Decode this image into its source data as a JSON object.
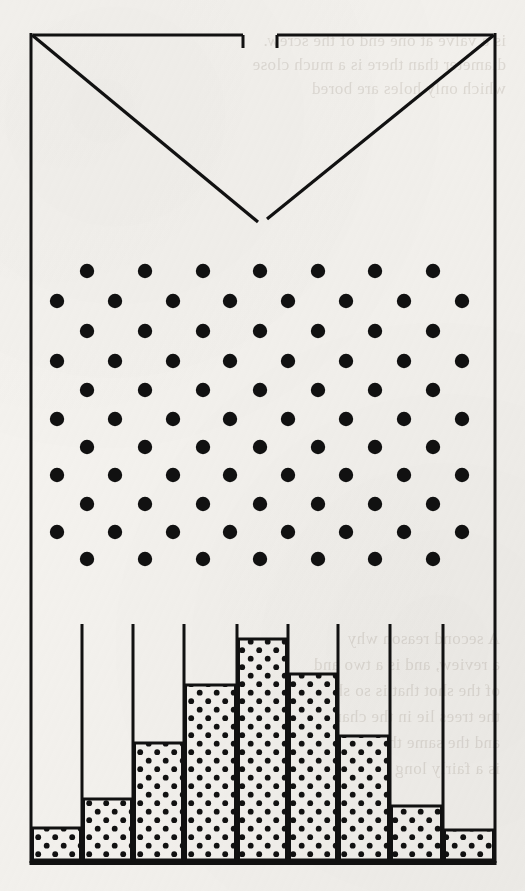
{
  "figure": {
    "name": "galton-board-quincunx-diagram",
    "ink_color": "#111111",
    "paper_color": "#f6f4f0",
    "frame": {
      "left": 31,
      "right": 495,
      "top": 33,
      "bottom": 863,
      "stroke_width": 3
    },
    "funnel": {
      "name": "funnel-hopper",
      "top_gap_left": 243,
      "top_gap_right": 277,
      "apex_x": 263,
      "apex_y": 222,
      "left_lip_x": 33,
      "right_lip_x": 493,
      "lip_y": 35,
      "lip_tick_height": 13
    },
    "peg_array": {
      "name": "peg-array",
      "rows": 11,
      "dot_radius": 7.2,
      "row_y": [
        271,
        301,
        331,
        361,
        390,
        419,
        447,
        475,
        504,
        532,
        559
      ],
      "odd_row_x": [
        87,
        145,
        203,
        260,
        318,
        375,
        433
      ],
      "even_row_x": [
        57,
        115,
        173,
        230,
        288,
        346,
        404,
        462
      ],
      "odd_row_count": 7,
      "even_row_count": 8,
      "first_row_type": "odd"
    },
    "bins": {
      "name": "collecting-bins",
      "count": 9,
      "divider_top_y": 624,
      "baseline_y": 861,
      "divider_x": [
        31,
        82,
        133,
        184,
        237,
        288,
        338,
        390,
        443,
        495
      ],
      "fill_pattern": "stipple-dots"
    }
  },
  "chart_data": {
    "type": "bar",
    "title": "",
    "subtitle": "",
    "xlabel": "",
    "ylabel": "",
    "categories": [
      "1",
      "2",
      "3",
      "4",
      "5",
      "6",
      "7",
      "8",
      "9"
    ],
    "values": [
      33,
      62,
      118,
      176,
      222,
      187,
      125,
      55,
      31
    ],
    "bar_top_y": [
      828,
      799,
      743,
      685,
      639,
      674,
      736,
      806,
      830
    ],
    "bar_left_x": [
      31,
      82,
      133,
      184,
      237,
      288,
      338,
      390,
      443
    ],
    "bar_right_x": [
      82,
      133,
      184,
      237,
      288,
      338,
      390,
      443,
      495
    ],
    "baseline_y": 861,
    "ylim": [
      0,
      237
    ],
    "grid": false,
    "legend": null,
    "annotations": [],
    "note": "Bar heights in pixels above the baseline; shape approximates a binomial / normal distribution."
  },
  "ghost_text": {
    "name": "reverse-side-show-through",
    "lines": [
      "is a valve at one end of the screw.",
      "diameter than there is a much close",
      "which only holes are bored"
    ],
    "lines_lower": [
      "A second reason why",
      "a review, and is a two and",
      "of the shot that is so short",
      "the trees lie in the cham",
      "and the same thing elsewhere",
      "is a fairly long and most"
    ]
  }
}
